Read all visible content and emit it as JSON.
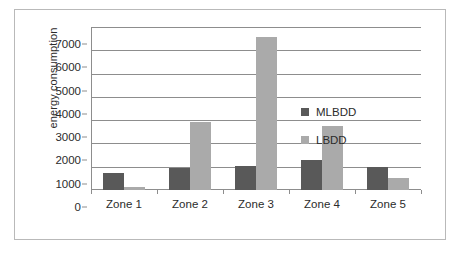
{
  "chart_data": {
    "type": "bar",
    "title": "",
    "xlabel": "",
    "ylabel": "energy consumption",
    "ylim": [
      0,
      7000
    ],
    "ytick_step": 1000,
    "yticks": [
      0,
      1000,
      2000,
      3000,
      4000,
      5000,
      6000,
      7000
    ],
    "ytick_labels": [
      "0",
      "1000",
      "2000",
      "3000",
      "4000",
      "5000",
      "6000",
      "7000"
    ],
    "categories": [
      "Zone 1",
      "Zone 2",
      "Zone 3",
      "Zone 4",
      "Zone 5"
    ],
    "series": [
      {
        "name": "MLBDD",
        "color": "#595959",
        "values": [
          750,
          950,
          1050,
          1300,
          1000
        ]
      },
      {
        "name": "LBDD",
        "color": "#aaaaaa",
        "values": [
          150,
          2900,
          6550,
          2750,
          500
        ]
      }
    ],
    "grid": {
      "horizontal": true,
      "vertical": false
    },
    "legend": {
      "position": "inside-right",
      "entries": [
        "MLBDD",
        "LBDD"
      ]
    }
  },
  "figure": {
    "border_color": "#b9b9b9",
    "axis_color": "#8d8d8d",
    "text_color": "#2b2b2b",
    "background": "#ffffff"
  }
}
